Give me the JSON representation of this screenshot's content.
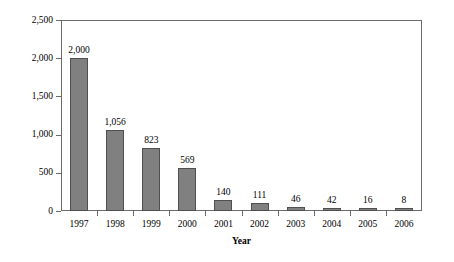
{
  "chart_data": {
    "type": "bar",
    "title": "",
    "xlabel": "Year",
    "ylabel": "Parts Per Million",
    "categories": [
      "1997",
      "1998",
      "1999",
      "2000",
      "2001",
      "2002",
      "2003",
      "2004",
      "2005",
      "2006"
    ],
    "values": [
      2000,
      1056,
      823,
      569,
      140,
      111,
      46,
      42,
      16,
      8
    ],
    "value_labels": [
      "2,000",
      "1,056",
      "823",
      "569",
      "140",
      "111",
      "46",
      "42",
      "16",
      "8"
    ],
    "ylim": [
      0,
      2500
    ],
    "ytick_values": [
      0,
      500,
      1000,
      1500,
      2000,
      2500
    ],
    "ytick_labels": [
      "0",
      "500",
      "1,000",
      "1,500",
      "2,000",
      "2,500"
    ],
    "grid": false,
    "legend": null,
    "bar_color": "#808080",
    "bar_edge_color": "#4f4f4f",
    "axis_color": "#6b6b6b",
    "background": "#ffffff"
  }
}
